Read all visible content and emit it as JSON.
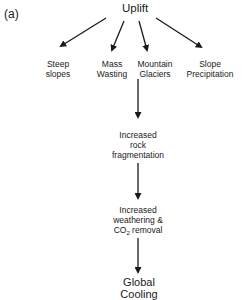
{
  "panel_label": "(a)",
  "root": "Uplift",
  "branches": [
    {
      "line1": "Steep",
      "line2": "slopes"
    },
    {
      "line1": "Mass",
      "line2": "Wasting"
    },
    {
      "line1": "Mountain",
      "line2": "Glaciers"
    },
    {
      "line1": "Slope",
      "line2": "Precipitation"
    }
  ],
  "chain": [
    {
      "line1": "Increased",
      "line2": "rock",
      "line3": "fragmentation"
    },
    {
      "line1": "Increased",
      "line2": "weathering &",
      "line3_pre": "CO",
      "line3_sub": "2",
      "line3_post": " removal"
    }
  ],
  "result": "Global Cooling",
  "colors": {
    "ink": "#1a1a1a",
    "background": "#ffffff"
  }
}
